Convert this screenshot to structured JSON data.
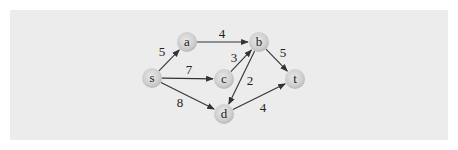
{
  "diagram": {
    "type": "directed-weighted-graph",
    "colors": {
      "background": "#ececec",
      "node_fill": "#c8c8c8",
      "node_highlight": "#e6e6e6",
      "edge": "#333333",
      "text": "#222222"
    },
    "nodes": [
      {
        "id": "s",
        "label": "s",
        "x": 152,
        "y": 78
      },
      {
        "id": "a",
        "label": "a",
        "x": 187,
        "y": 42
      },
      {
        "id": "b",
        "label": "b",
        "x": 259,
        "y": 42
      },
      {
        "id": "c",
        "label": "c",
        "x": 224,
        "y": 79
      },
      {
        "id": "d",
        "label": "d",
        "x": 224,
        "y": 114
      },
      {
        "id": "t",
        "label": "t",
        "x": 295,
        "y": 79
      }
    ],
    "edges": [
      {
        "from": "s",
        "to": "a",
        "weight": "5",
        "lx": 162,
        "ly": 56
      },
      {
        "from": "a",
        "to": "b",
        "weight": "4",
        "lx": 222,
        "ly": 38
      },
      {
        "from": "s",
        "to": "c",
        "weight": "7",
        "lx": 189,
        "ly": 74
      },
      {
        "from": "c",
        "to": "b",
        "weight": "3",
        "lx": 234,
        "ly": 62
      },
      {
        "from": "b",
        "to": "d",
        "weight": "2",
        "lx": 250,
        "ly": 85
      },
      {
        "from": "s",
        "to": "d",
        "weight": "8",
        "lx": 180,
        "ly": 107
      },
      {
        "from": "b",
        "to": "t",
        "weight": "5",
        "lx": 283,
        "ly": 57
      },
      {
        "from": "d",
        "to": "t",
        "weight": "4",
        "lx": 263,
        "ly": 112
      }
    ]
  }
}
